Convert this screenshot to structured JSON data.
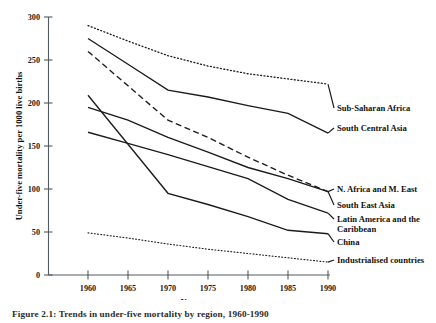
{
  "chart_data": {
    "type": "line",
    "title": "",
    "xlabel": "Year",
    "ylabel": "Under-five mortality per 1000 live births",
    "x": [
      1960,
      1965,
      1970,
      1975,
      1980,
      1985,
      1990
    ],
    "xlim": [
      1960,
      1990
    ],
    "ylim": [
      0,
      300
    ],
    "xticks": [
      "1960",
      "1965",
      "1970",
      "1975",
      "1980",
      "1985",
      "1990"
    ],
    "yticks": [
      "0",
      "50",
      "100",
      "150",
      "200",
      "250",
      "300"
    ],
    "grid": false,
    "legend_position": "right-inline-labels",
    "series": [
      {
        "name": "Sub-Saharan Africa",
        "style": "dotted",
        "values": [
          290,
          272,
          255,
          243,
          234,
          228,
          222
        ]
      },
      {
        "name": "South Central Asia",
        "style": "solid",
        "values": [
          275,
          245,
          215,
          207,
          197,
          188,
          165
        ]
      },
      {
        "name": "N. Africa and M. East",
        "style": "dashed",
        "values": [
          260,
          220,
          180,
          160,
          137,
          116,
          97
        ]
      },
      {
        "name": "South East Asia",
        "style": "solid",
        "values": [
          195,
          180,
          160,
          143,
          125,
          112,
          97
        ]
      },
      {
        "name": "Latin America and the Caribbean",
        "style": "solid",
        "values": [
          166,
          153,
          140,
          126,
          112,
          88,
          72
        ]
      },
      {
        "name": "China",
        "style": "solid",
        "values": [
          209,
          152,
          95,
          82,
          68,
          52,
          48
        ]
      },
      {
        "name": "Industrialised countries",
        "style": "finedotted",
        "values": [
          49,
          43,
          36,
          30,
          25,
          20,
          15
        ]
      }
    ]
  },
  "caption": {
    "text": "Figure 2.1: Trends in under-five mortality by region, 1960-1990"
  }
}
